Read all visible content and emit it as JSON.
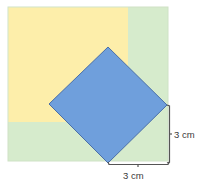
{
  "diagram": {
    "outer_square": {
      "x": 8,
      "y": 7,
      "w": 160,
      "h": 154,
      "fill": "#d6ebcc",
      "stroke": "#c8dcc0"
    },
    "yellow_square": {
      "x": 8,
      "y": 7,
      "w": 120,
      "h": 115,
      "fill": "#fdeeaa"
    },
    "blue_square": {
      "points": "108,47 167,105 108,163 49,104",
      "fill": "#6f9fdc",
      "stroke": "#4a6fa8"
    },
    "dimensions": [
      {
        "name": "vertical-dimension",
        "label": "3 cm"
      },
      {
        "name": "horizontal-dimension",
        "label": "3 cm"
      }
    ],
    "colors": {
      "yellow": "#fdeeaa",
      "green": "#d6ebcc",
      "blue": "#6f9fdc",
      "bracket": "#555555"
    }
  }
}
